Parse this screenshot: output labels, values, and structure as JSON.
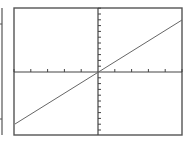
{
  "chart_data": {
    "type": "line",
    "title": "",
    "xlabel": "",
    "ylabel": "",
    "xlim": [
      -5,
      5
    ],
    "ylim": [
      -11,
      11
    ],
    "grid": false,
    "legend": null,
    "axes_through_origin": true,
    "x_ticks": [
      -5,
      -4,
      -3,
      -2,
      -1,
      1,
      2,
      3,
      4,
      5
    ],
    "y_ticks": [
      -11,
      -10,
      -9,
      -8,
      -7,
      -6,
      -5,
      -4,
      -3,
      -2,
      -1,
      1,
      2,
      3,
      4,
      5,
      6,
      7,
      8,
      9,
      10,
      11
    ],
    "series": [
      {
        "name": "line",
        "x": [
          -5,
          5
        ],
        "y": [
          -9,
          9
        ]
      }
    ]
  },
  "colors": {
    "frame": "#555555",
    "axes": "#444444",
    "line": "#666666",
    "background": "#ffffff"
  },
  "layout": {
    "frame": {
      "x": 14,
      "y": 8,
      "w": 168,
      "h": 127
    },
    "origin": {
      "x": 98,
      "y": 72
    },
    "x_tick_spacing": 16.8,
    "y_tick_spacing": 5.8,
    "line": {
      "x1": 15,
      "y1": 124,
      "x2": 182,
      "y2": 20
    },
    "left_panel_edge": {
      "x": 2,
      "y1": 8,
      "y2": 135,
      "ticks_y": [
        24,
        119
      ]
    }
  }
}
